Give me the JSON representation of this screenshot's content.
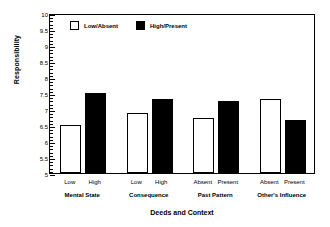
{
  "chart_data": {
    "type": "bar",
    "title": "",
    "xlabel": "Deeds and Context",
    "ylabel": "Responsibility",
    "ylim": [
      5,
      10
    ],
    "ytick_labels": [
      "10",
      "9.5",
      "9",
      "8.5",
      "8",
      "7.5",
      "7",
      "6.5",
      "6",
      "5.5",
      "5"
    ],
    "ytick_values": [
      10,
      9.5,
      9,
      8.5,
      8,
      7.5,
      7,
      6.5,
      6,
      5.5,
      5
    ],
    "minor_ticks": true,
    "grid": false,
    "legend_position": "upper-left-inside",
    "categories": [
      "Mental State",
      "Consequence",
      "Past Pattern",
      "Other's Influence"
    ],
    "bar_labels": [
      [
        "Low",
        "High"
      ],
      [
        "Low",
        "High"
      ],
      [
        "Absent",
        "Present"
      ],
      [
        "Absent",
        "Present"
      ]
    ],
    "series": [
      {
        "name": "Low/Absent",
        "color": "#ffffff",
        "edge_color": "#000000",
        "values": [
          6.51,
          6.87,
          6.72,
          7.3
        ]
      },
      {
        "name": "High/Present",
        "color": "#000000",
        "edge_color": "#000000",
        "values": [
          7.49,
          7.3,
          7.25,
          6.65
        ]
      }
    ],
    "bars": [
      {
        "group": "Mental State",
        "label": "Low",
        "series": "Low/Absent",
        "value": 6.51,
        "fill": "open"
      },
      {
        "group": "Mental State",
        "label": "High",
        "series": "High/Present",
        "value": 7.49,
        "fill": "solid"
      },
      {
        "group": "Consequence",
        "label": "Low",
        "series": "Low/Absent",
        "value": 6.87,
        "fill": "open"
      },
      {
        "group": "Consequence",
        "label": "High",
        "series": "High/Present",
        "value": 7.3,
        "fill": "solid"
      },
      {
        "group": "Past Pattern",
        "label": "Absent",
        "series": "Low/Absent",
        "value": 6.72,
        "fill": "open"
      },
      {
        "group": "Past Pattern",
        "label": "Present",
        "series": "High/Present",
        "value": 7.25,
        "fill": "solid"
      },
      {
        "group": "Other's Influence",
        "label": "Absent",
        "series": "Low/Absent",
        "value": 7.3,
        "fill": "open"
      },
      {
        "group": "Other's Influence",
        "label": "Present",
        "series": "High/Present",
        "value": 6.65,
        "fill": "solid"
      }
    ]
  },
  "legend": {
    "items": [
      {
        "label": "Low/Absent",
        "fill": "open"
      },
      {
        "label": "High/Present",
        "fill": "solid"
      }
    ]
  }
}
